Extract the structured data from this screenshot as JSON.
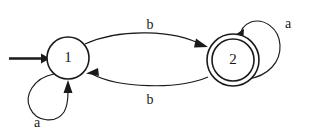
{
  "diagram": {
    "type": "state-transition-diagram",
    "background_color": "#ffffff",
    "stroke_color": "#1a1a1a",
    "states": [
      {
        "id": "1",
        "label": "1",
        "accepting": false,
        "initial": true,
        "cx": 68,
        "cy": 58,
        "r": 21
      },
      {
        "id": "2",
        "label": "2",
        "accepting": true,
        "initial": false,
        "cx": 233,
        "cy": 60,
        "r_outer": 26,
        "r_inner": 21
      }
    ],
    "transitions": [
      {
        "name": "one-to-two",
        "from": "1",
        "to": "2",
        "label": "b",
        "label_x": 150,
        "label_y": 26
      },
      {
        "name": "two-to-one",
        "from": "2",
        "to": "1",
        "label": "b",
        "label_x": 150,
        "label_y": 101
      },
      {
        "name": "one-self-loop",
        "from": "1",
        "to": "1",
        "label": "a",
        "label_x": 37,
        "label_y": 124
      },
      {
        "name": "two-self-loop",
        "from": "2",
        "to": "2",
        "label": "a",
        "label_x": 288,
        "label_y": 25
      }
    ],
    "start_arrow": {
      "name": "start-arrow",
      "x1": 8,
      "y1": 58,
      "x2": 47,
      "y2": 58
    }
  }
}
